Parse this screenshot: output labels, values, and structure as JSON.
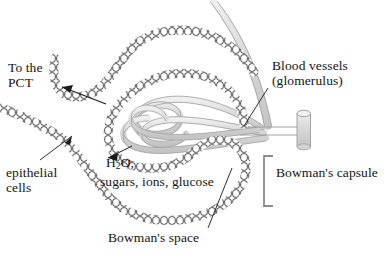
{
  "figure": {
    "background_color": "#ffffff",
    "text_color": "#141414",
    "cell_outline_color": "#2b2b2b",
    "vessel_fill_color": "#dcdcdc",
    "vessel_outline_color": "#9a9a9a",
    "bracket_color": "#8c8c8c",
    "leader_line_color": "#1a1a1a"
  },
  "labels": {
    "to_the_pct": {
      "line1": "To the",
      "line2": "PCT"
    },
    "blood_vessels": {
      "line1": "Blood vessels",
      "line2": "(glomerulus)"
    },
    "epithelial_cells": {
      "line1": "epithelial",
      "line2": "cells"
    },
    "filtrate": {
      "line1_pre": "H",
      "line1_sub": "2",
      "line1_post": "O,",
      "line2": "sugars, ions, glucose"
    },
    "bowmans_capsule": "Bowman's capsule",
    "bowmans_space": "Bowman's space"
  },
  "structures": {
    "epithelial_cell_chain": "chain-of-rounded-cells",
    "glomerulus": "tangled-capillary-loops",
    "vessel_trunk": "t-shaped-arteriole-stem",
    "capsule_bracket": "square-bracket"
  }
}
